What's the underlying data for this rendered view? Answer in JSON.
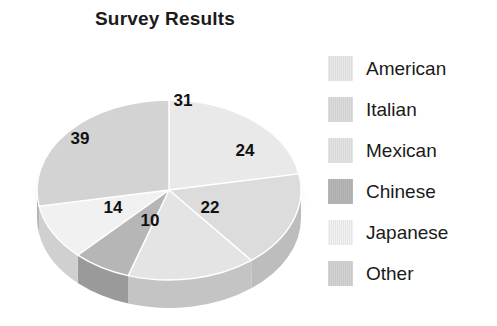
{
  "chart_data": {
    "type": "pie",
    "title": "Survey Results",
    "categories": [
      "American",
      "Italian",
      "Mexican",
      "Chinese",
      "Japanese",
      "Other"
    ],
    "values": [
      31,
      24,
      22,
      10,
      14,
      39
    ],
    "total": 140,
    "labels_shown": [
      "31",
      "24",
      "22",
      "10",
      "14",
      "39"
    ],
    "label_positions": [
      {
        "value": "31",
        "x": 169,
        "y": 58
      },
      {
        "value": "24",
        "x": 231,
        "y": 108
      },
      {
        "value": "22",
        "x": 196,
        "y": 165
      },
      {
        "value": "10",
        "x": 136,
        "y": 178
      },
      {
        "value": "14",
        "x": 99,
        "y": 165
      },
      {
        "value": "39",
        "x": 66,
        "y": 96
      }
    ],
    "colors": [
      "#e9e9e9",
      "#dcdcdc",
      "#e4e4e4",
      "#b6b6b6",
      "#f1f1f1",
      "#d3d3d3"
    ],
    "side_colors": [
      "#c9c9c9",
      "#bdbdbd",
      "#c4c4c4",
      "#9a9a9a",
      "#d0d0d0",
      "#b5b5b5"
    ],
    "three_d": true,
    "start_angle_deg": -90,
    "direction": "clockwise",
    "legend_position": "right",
    "grid": false,
    "xlabel": "",
    "ylabel": ""
  },
  "legend": {
    "items": [
      {
        "label": "American",
        "color": "#e9e9e9",
        "value": 31
      },
      {
        "label": "Italian",
        "color": "#dcdcdc",
        "value": 24
      },
      {
        "label": "Mexican",
        "color": "#e4e4e4",
        "value": 22
      },
      {
        "label": "Chinese",
        "color": "#b6b6b6",
        "value": 10
      },
      {
        "label": "Japanese",
        "color": "#f1f1f1",
        "value": 14
      },
      {
        "label": "Other",
        "color": "#d3d3d3",
        "value": 39
      }
    ]
  }
}
